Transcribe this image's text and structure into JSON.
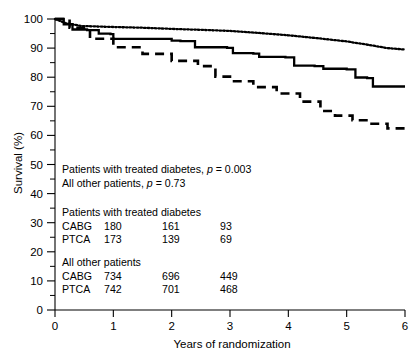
{
  "chart_data": {
    "type": "line",
    "title": "",
    "xlabel": "Years of randomization",
    "ylabel": "Survival (%)",
    "xlim": [
      0,
      6
    ],
    "ylim": [
      0,
      100
    ],
    "xticks": [
      0,
      1,
      2,
      3,
      4,
      5,
      6
    ],
    "yticks": [
      0,
      10,
      20,
      30,
      40,
      50,
      60,
      70,
      80,
      90,
      100
    ],
    "yticks_minor": [
      5,
      15,
      25,
      35,
      45,
      55,
      65,
      75,
      85,
      95
    ],
    "grid": false,
    "legend": "none",
    "series": [
      {
        "name": "All other patients",
        "style": "dotted",
        "color": "#000000",
        "x": [
          0,
          0.18,
          0.45,
          0.9,
          1.5,
          2.0,
          2.6,
          3.0,
          3.5,
          4.0,
          4.5,
          5.0,
          5.35,
          5.7,
          6.0
        ],
        "y": [
          100,
          98.6,
          97.6,
          97.3,
          97.0,
          96.6,
          96.2,
          95.9,
          95.2,
          94.4,
          93.4,
          92.3,
          91.2,
          90.0,
          89.5
        ]
      },
      {
        "name": "Patients with treated diabetes, CABG",
        "style": "solid",
        "color": "#000000",
        "x": [
          0,
          0.15,
          0.3,
          0.55,
          0.75,
          0.95,
          1.0,
          2.0,
          2.15,
          2.4,
          2.95,
          3.05,
          3.4,
          3.5,
          3.95,
          4.1,
          4.45,
          4.6,
          5.0,
          5.15,
          5.35,
          5.45,
          6.0
        ],
        "y": [
          100,
          98.2,
          96.4,
          96.2,
          95.0,
          94.8,
          93.2,
          92.6,
          92.4,
          90.3,
          90.1,
          88.3,
          88.1,
          87.0,
          86.8,
          84.0,
          83.8,
          82.9,
          82.7,
          79.9,
          79.7,
          76.8,
          76.8
        ]
      },
      {
        "name": "Patients with treated diabetes, PTCA",
        "style": "dashed",
        "color": "#000000",
        "x": [
          0,
          0.25,
          0.6,
          1.0,
          1.5,
          2.0,
          2.45,
          2.75,
          3.0,
          3.4,
          3.8,
          4.2,
          4.55,
          4.8,
          5.1,
          5.4,
          5.7,
          6.0
        ],
        "y": [
          100,
          97.0,
          93.2,
          90.3,
          88.0,
          85.6,
          83.8,
          80.2,
          78.6,
          76.6,
          74.4,
          71.6,
          68.4,
          66.8,
          65.2,
          64.0,
          62.4,
          61.0
        ]
      }
    ],
    "annotations": {
      "pvalue_lines": [
        {
          "prefix": "Patients with treated diabetes, ",
          "italic": "p",
          "suffix": " = 0.003"
        },
        {
          "prefix": "All other patients, ",
          "italic": "p",
          "suffix": " = 0.73"
        }
      ],
      "at_risk_tables": [
        {
          "title": "Patients with treated diabetes",
          "rows": [
            {
              "label": "CABG",
              "values": [
                "180",
                "161",
                "93"
              ]
            },
            {
              "label": "PTCA",
              "values": [
                "173",
                "139",
                "69"
              ]
            }
          ]
        },
        {
          "title": "All other patients",
          "rows": [
            {
              "label": "CABG",
              "values": [
                "734",
                "696",
                "449"
              ]
            },
            {
              "label": "PTCA",
              "values": [
                "742",
                "701",
                "468"
              ]
            }
          ]
        }
      ]
    }
  }
}
